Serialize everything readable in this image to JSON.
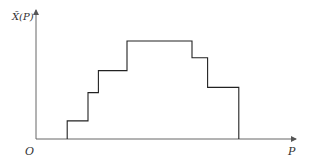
{
  "chart_data": {
    "type": "line",
    "subtype": "step",
    "title": "",
    "xlabel": "P",
    "ylabel": "X̃(P)",
    "origin_label": "O",
    "grid": false,
    "legend": "none",
    "xlim": [
      0,
      10
    ],
    "ylim": [
      0,
      10
    ],
    "step_points": [
      {
        "x": 1.2,
        "y": 0
      },
      {
        "x": 1.2,
        "y": 1.4
      },
      {
        "x": 2.0,
        "y": 1.4
      },
      {
        "x": 2.0,
        "y": 3.6
      },
      {
        "x": 2.4,
        "y": 3.6
      },
      {
        "x": 2.4,
        "y": 5.3
      },
      {
        "x": 3.5,
        "y": 5.3
      },
      {
        "x": 3.5,
        "y": 7.6
      },
      {
        "x": 6.0,
        "y": 7.6
      },
      {
        "x": 6.0,
        "y": 6.3
      },
      {
        "x": 6.6,
        "y": 6.3
      },
      {
        "x": 6.6,
        "y": 4.0
      },
      {
        "x": 7.8,
        "y": 4.0
      },
      {
        "x": 7.8,
        "y": 0
      }
    ]
  }
}
